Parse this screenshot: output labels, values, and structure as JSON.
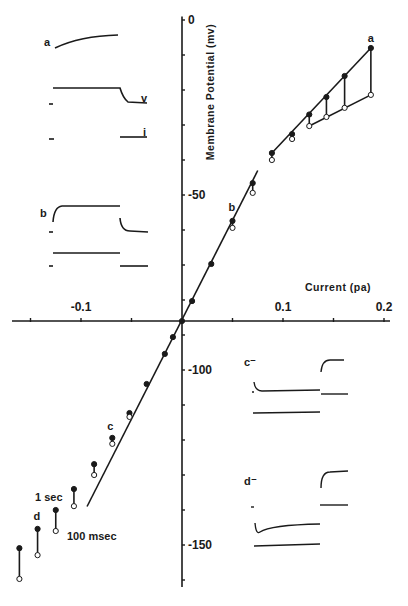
{
  "chart_data": {
    "type": "scatter",
    "title": "",
    "xlabel": "Current (pa)",
    "ylabel": "Membrane Potential (mv)",
    "xlim": [
      -0.18,
      0.2
    ],
    "ylim": [
      -160,
      0
    ],
    "x_tick_values": [
      -0.15,
      -0.1,
      -0.05,
      0,
      0.05,
      0.1,
      0.15,
      0.2
    ],
    "x_tick_labels": [
      {
        "value": -0.1,
        "text": "-0.1"
      },
      {
        "value": 0.1,
        "text": "0.1"
      },
      {
        "value": 0.2,
        "text": "0.2"
      }
    ],
    "y_tick_values": [
      0,
      -10,
      -20,
      -30,
      -40,
      -50,
      -60,
      -70,
      -80,
      -90,
      -100,
      -110,
      -120,
      -130,
      -140,
      -150,
      -160
    ],
    "y_tick_labels": [
      {
        "value": 0,
        "text": "0"
      },
      {
        "value": -50,
        "text": "-50"
      },
      {
        "value": -100,
        "text": "-100"
      },
      {
        "value": -150,
        "text": "-150"
      }
    ],
    "x_axis_crosses_at_mv": -86,
    "grid": false,
    "series": [
      {
        "name": "1 sec",
        "marker": "filled-circle",
        "points": [
          {
            "x": 0.187,
            "y": -8
          },
          {
            "x": 0.161,
            "y": -16
          },
          {
            "x": 0.143,
            "y": -22
          },
          {
            "x": 0.126,
            "y": -27
          },
          {
            "x": 0.109,
            "y": -32.6
          },
          {
            "x": 0.089,
            "y": -38
          },
          {
            "x": 0.07,
            "y": -46.6
          },
          {
            "x": 0.05,
            "y": -57.4
          },
          {
            "x": 0.029,
            "y": -69.7
          },
          {
            "x": 0.01,
            "y": -80.3
          },
          {
            "x": 0.0,
            "y": -86
          },
          {
            "x": -0.009,
            "y": -90.6
          },
          {
            "x": -0.017,
            "y": -95.4
          },
          {
            "x": -0.035,
            "y": -104
          },
          {
            "x": -0.052,
            "y": -112.3
          },
          {
            "x": -0.069,
            "y": -119.4
          },
          {
            "x": -0.087,
            "y": -126.9
          },
          {
            "x": -0.107,
            "y": -134
          },
          {
            "x": -0.125,
            "y": -140
          },
          {
            "x": -0.143,
            "y": -145.4
          },
          {
            "x": -0.161,
            "y": -150.9
          }
        ]
      },
      {
        "name": "100 msec",
        "marker": "open-circle",
        "points": [
          {
            "x": 0.187,
            "y": -21.4
          },
          {
            "x": 0.161,
            "y": -25.1
          },
          {
            "x": 0.143,
            "y": -27.7
          },
          {
            "x": 0.126,
            "y": -30.3
          },
          {
            "x": 0.109,
            "y": -34
          },
          {
            "x": 0.089,
            "y": -40
          },
          {
            "x": 0.07,
            "y": -49.4
          },
          {
            "x": 0.05,
            "y": -59.4
          },
          {
            "x": -0.052,
            "y": -113.4
          },
          {
            "x": -0.069,
            "y": -121.1
          },
          {
            "x": -0.087,
            "y": -130
          },
          {
            "x": -0.107,
            "y": -138.9
          },
          {
            "x": -0.125,
            "y": -146
          },
          {
            "x": -0.143,
            "y": -152.9
          },
          {
            "x": -0.161,
            "y": -159.7
          }
        ]
      }
    ],
    "fit_lines": [
      {
        "name": "1 sec upper",
        "from": {
          "x": 0.089,
          "y": -38
        },
        "to": {
          "x": 0.187,
          "y": -8
        }
      },
      {
        "name": "1 sec central",
        "from": {
          "x": -0.094,
          "y": -139
        },
        "to": {
          "x": 0.075,
          "y": -43
        }
      },
      {
        "name": "100 msec upper",
        "from": {
          "x": 0.126,
          "y": -30.3
        },
        "to": {
          "x": 0.187,
          "y": -21.4
        }
      }
    ],
    "point_labels": [
      {
        "text": "a",
        "x": 0.187,
        "y": -8
      },
      {
        "text": "b",
        "x": 0.05,
        "y": -57.4
      },
      {
        "text": "c",
        "x": -0.069,
        "y": -119.4
      },
      {
        "text": "d",
        "x": -0.143,
        "y": -145.4
      }
    ],
    "annotations": [
      "1 sec",
      "100 msec"
    ],
    "insets": [
      {
        "label": "a",
        "traces": [
          "v",
          "i"
        ]
      },
      {
        "label": "b",
        "traces": []
      },
      {
        "label": "c",
        "traces": []
      },
      {
        "label": "d",
        "traces": []
      }
    ]
  }
}
